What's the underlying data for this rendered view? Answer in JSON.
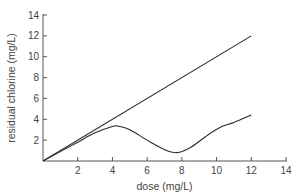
{
  "chart_data": {
    "type": "line",
    "title": "",
    "xlabel": "dose (mg/L)",
    "ylabel": "residual chlorine (mg/L)",
    "xlim": [
      0,
      14
    ],
    "ylim": [
      0,
      14
    ],
    "xticks": [
      2,
      4,
      6,
      8,
      10,
      12,
      14
    ],
    "yticks": [
      2,
      4,
      6,
      8,
      10,
      12,
      14
    ],
    "grid": false,
    "legend": null,
    "series": [
      {
        "name": "dose = residual (no demand)",
        "x": [
          0,
          12
        ],
        "y": [
          0,
          12
        ]
      },
      {
        "name": "breakpoint chlorination curve",
        "x": [
          0,
          1,
          2,
          3,
          4,
          4.3,
          5,
          6,
          7,
          7.7,
          8.5,
          9.5,
          10.3,
          11,
          12
        ],
        "y": [
          0,
          0.9,
          1.8,
          2.7,
          3.3,
          3.35,
          3.0,
          2.0,
          1.1,
          0.8,
          1.3,
          2.5,
          3.3,
          3.7,
          4.4
        ]
      }
    ],
    "colors": {
      "line": "#2a2a2a",
      "axis": "#555555",
      "text": "#444444"
    }
  }
}
